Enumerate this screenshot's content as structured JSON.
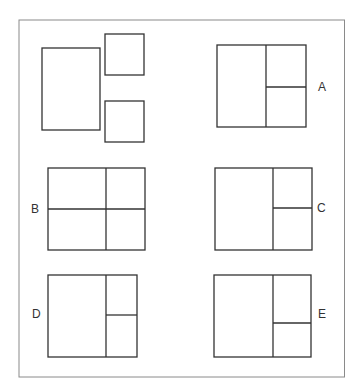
{
  "colors": {
    "stroke": "#333333",
    "frame": "#8a8a8a",
    "background": "#ffffff"
  },
  "question": {
    "pieces": [
      {
        "name": "large-rectangle",
        "x": 42,
        "y": 48,
        "w": 58,
        "h": 82
      },
      {
        "name": "small-square-top",
        "x": 105,
        "y": 34,
        "w": 39,
        "h": 41
      },
      {
        "name": "small-square-bottom",
        "x": 105,
        "y": 101,
        "w": 39,
        "h": 41
      }
    ]
  },
  "options": [
    {
      "label": "A",
      "x": 217,
      "y": 45,
      "w": 89,
      "h": 82,
      "vx": 266,
      "hy": 87,
      "hfull": false,
      "lx": 318,
      "ly": 91
    },
    {
      "label": "B",
      "x": 48,
      "y": 168,
      "w": 97,
      "h": 82,
      "vx": 106,
      "hy": 209,
      "hfull": true,
      "lx": 31,
      "ly": 213
    },
    {
      "label": "C",
      "x": 215,
      "y": 168,
      "w": 97,
      "h": 82,
      "vx": 273,
      "hy": 208,
      "hfull": false,
      "lx": 317,
      "ly": 212
    },
    {
      "label": "D",
      "x": 48,
      "y": 275,
      "w": 89,
      "h": 82,
      "vx": 106,
      "hy": 315,
      "hfull": false,
      "lx": 32,
      "ly": 318
    },
    {
      "label": "E",
      "x": 214,
      "y": 275,
      "w": 97,
      "h": 82,
      "vx": 273,
      "hy": 323,
      "hfull": false,
      "lx": 318,
      "ly": 318
    }
  ]
}
